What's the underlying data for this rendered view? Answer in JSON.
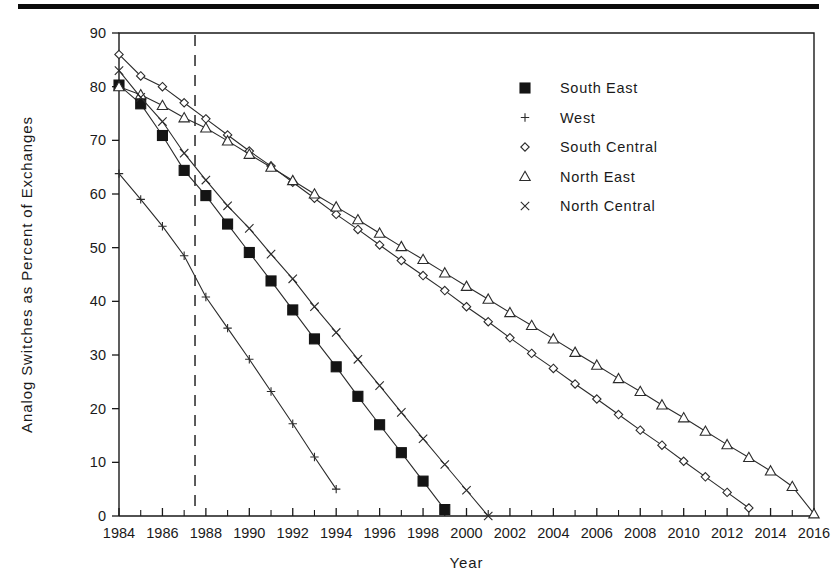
{
  "figure": {
    "top_rule": "page-separator-rule"
  },
  "chart_data": {
    "type": "line",
    "title": "",
    "xlabel": "Year",
    "ylabel": "Analog Switches as Percent of Exchanges",
    "xlim": [
      1984,
      2016
    ],
    "ylim": [
      0,
      90
    ],
    "xticks": [
      1984,
      1986,
      1988,
      1990,
      1992,
      1994,
      1996,
      1998,
      2000,
      2002,
      2004,
      2006,
      2008,
      2010,
      2012,
      2014,
      2016
    ],
    "xtick_labels": [
      "1984",
      "1986",
      "1988",
      "1990",
      "1992",
      "1994",
      "1996",
      "1998",
      "2000",
      "2002",
      "2004",
      "2006",
      "2008",
      "2010",
      "2012",
      "2014",
      "2016"
    ],
    "xtick_minor_step": 1,
    "yticks": [
      0,
      10,
      20,
      30,
      40,
      50,
      60,
      70,
      80,
      90
    ],
    "ytick_labels": [
      "0",
      "10",
      "20",
      "30",
      "40",
      "50",
      "60",
      "70",
      "80",
      "90"
    ],
    "grid": false,
    "legend_position": "upper-right-inside",
    "annotations": [
      {
        "name": "forecast-divider",
        "type": "vline",
        "x": 1987.5,
        "style": "dashed"
      }
    ],
    "series": [
      {
        "name": "South East",
        "marker": "filled-square",
        "x": [
          1984,
          1985,
          1986,
          1987,
          1988,
          1989,
          1990,
          1991,
          1992,
          1993,
          1994,
          1995,
          1996,
          1997,
          1998,
          1999
        ],
        "values": [
          80.3,
          76.8,
          70.9,
          64.4,
          59.7,
          54.4,
          49.1,
          43.8,
          38.4,
          33.0,
          27.8,
          22.3,
          17.0,
          11.8,
          6.5,
          1.2
        ]
      },
      {
        "name": "West",
        "marker": "plus",
        "x": [
          1984,
          1985,
          1986,
          1987,
          1988,
          1989,
          1990,
          1991,
          1992,
          1993,
          1994
        ],
        "values": [
          63.8,
          59.0,
          54.0,
          48.5,
          40.8,
          35.0,
          29.2,
          23.2,
          17.2,
          11.0,
          5.0
        ]
      },
      {
        "name": "South Central",
        "marker": "diamond",
        "x": [
          1984,
          1985,
          1986,
          1987,
          1988,
          1989,
          1990,
          1991,
          1992,
          1993,
          1994,
          1995,
          1996,
          1997,
          1998,
          1999,
          2000,
          2001,
          2002,
          2003,
          2004,
          2005,
          2006,
          2007,
          2008,
          2009,
          2010,
          2011,
          2012,
          2013
        ],
        "values": [
          86.0,
          82.0,
          80.0,
          77.0,
          74.0,
          71.0,
          68.0,
          65.2,
          62.2,
          59.2,
          56.2,
          53.4,
          50.5,
          47.6,
          44.8,
          42.0,
          39.0,
          36.2,
          33.2,
          30.3,
          27.5,
          24.6,
          21.8,
          18.9,
          16.0,
          13.2,
          10.2,
          7.3,
          4.4,
          1.5
        ]
      },
      {
        "name": "North East",
        "marker": "triangle",
        "x": [
          1984,
          1985,
          1986,
          1987,
          1988,
          1989,
          1990,
          1991,
          1992,
          1993,
          1994,
          1995,
          1996,
          1997,
          1998,
          1999,
          2000,
          2001,
          2002,
          2003,
          2004,
          2005,
          2006,
          2007,
          2008,
          2009,
          2010,
          2011,
          2012,
          2013,
          2014,
          2015,
          2016
        ],
        "values": [
          80.0,
          78.5,
          76.5,
          74.2,
          72.3,
          69.9,
          67.4,
          65.0,
          62.5,
          60.0,
          57.6,
          55.2,
          52.7,
          50.2,
          47.8,
          45.3,
          42.8,
          40.4,
          37.9,
          35.5,
          33.0,
          30.5,
          28.1,
          25.6,
          23.2,
          20.7,
          18.3,
          15.8,
          13.3,
          10.9,
          8.4,
          5.5,
          0.4
        ]
      },
      {
        "name": "North Central",
        "marker": "x-cross",
        "x": [
          1984,
          1985,
          1986,
          1987,
          1988,
          1989,
          1990,
          1991,
          1992,
          1993,
          1994,
          1995,
          1996,
          1997,
          1998,
          1999,
          2000,
          2001
        ],
        "values": [
          83.0,
          78.0,
          73.5,
          67.6,
          62.6,
          57.8,
          53.6,
          48.8,
          44.2,
          39.0,
          34.2,
          29.2,
          24.3,
          19.3,
          14.4,
          9.6,
          4.8,
          0.0
        ]
      }
    ],
    "legend": [
      {
        "label": "South East",
        "marker": "filled-square"
      },
      {
        "label": "West",
        "marker": "plus"
      },
      {
        "label": "South Central",
        "marker": "diamond"
      },
      {
        "label": "North East",
        "marker": "triangle"
      },
      {
        "label": "North Central",
        "marker": "x-cross"
      }
    ]
  }
}
